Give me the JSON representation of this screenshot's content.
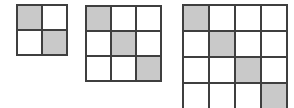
{
  "figure": {
    "background": "#ffffff",
    "colors": {
      "border": "#3f3f3f",
      "shaded_fill": "#c9c9c9",
      "unshaded_fill": "#ffffff"
    },
    "grids": [
      {
        "name": "grid-2x2",
        "rows": 2,
        "cols": 2,
        "cell_px": 23,
        "x": 16,
        "y": 4,
        "shaded_cells": [
          [
            0,
            0
          ],
          [
            1,
            1
          ]
        ]
      },
      {
        "name": "grid-3x3",
        "rows": 3,
        "cols": 3,
        "cell_px": 23,
        "x": 85,
        "y": 5,
        "shaded_cells": [
          [
            0,
            0
          ],
          [
            1,
            1
          ],
          [
            2,
            2
          ]
        ]
      },
      {
        "name": "grid-4x4",
        "rows": 4,
        "cols": 4,
        "cell_px": 24,
        "x": 182,
        "y": 4,
        "shaded_cells": [
          [
            0,
            0
          ],
          [
            1,
            1
          ],
          [
            2,
            2
          ],
          [
            3,
            3
          ]
        ]
      }
    ]
  }
}
